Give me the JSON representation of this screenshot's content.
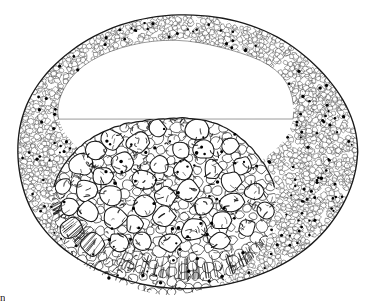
{
  "figure": {
    "kind": "histological-drawing",
    "caption_fragment": "n",
    "background_color": "#ffffff",
    "ink_color": "#1a1a1a",
    "nucleus_color": "#000000",
    "cell_fill_color": "#ffffff"
  },
  "geometry": {
    "canvas_width": 369,
    "canvas_height": 307,
    "outer_boundary": {
      "center_x": 186,
      "center_y": 152,
      "radius_x": 170,
      "radius_y": 137,
      "top_y": 15,
      "bottom_y": 288,
      "left_x": 14,
      "right_x": 356
    },
    "cavity": {
      "center_x": 176,
      "center_y": 112,
      "radius_x": 118,
      "radius_y": 72
    },
    "inner_cell_mass": {
      "center_x": 165,
      "center_y": 205,
      "radius_x": 112,
      "radius_y": 88,
      "top_y": 113
    }
  },
  "regions": [
    {
      "id": "trophoblast-ring",
      "label": "outer cellular wall",
      "wall_thickness_left": 28,
      "wall_thickness_top": 30,
      "wall_thickness_right": 62,
      "wall_thickness_bottom": 34,
      "cell_size": 5,
      "cell_count": 1650,
      "nuclei_count": 120,
      "shade": "stippled"
    },
    {
      "id": "blastocoel",
      "label": "central cavity",
      "shade": "blank"
    },
    {
      "id": "inner-cell-mass",
      "label": "inner cell mass",
      "cell_size_large": 17,
      "cell_size_small": 9,
      "cell_count": 320,
      "nuclei_count": 64,
      "shade": "outlined"
    }
  ],
  "chart_data": {
    "type": "scatter",
    "title": "",
    "xlabel": "",
    "ylabel": "",
    "series": [
      {
        "name": "outer-wall-cells",
        "count": 1650
      },
      {
        "name": "inner-mass-cells",
        "count": 320
      },
      {
        "name": "visible-nuclei",
        "count": 184
      }
    ]
  }
}
